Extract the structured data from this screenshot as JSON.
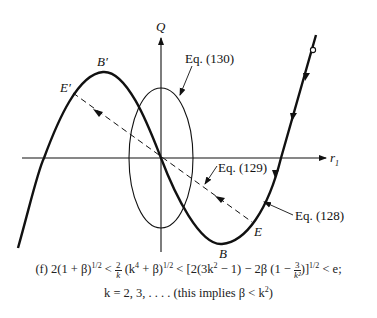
{
  "figure": {
    "type": "phase-plane diagram",
    "axes": {
      "x_label": "r",
      "x_label_sub": "1",
      "y_label": "Q"
    },
    "points": {
      "B_prime": "B′",
      "E_prime": "E′",
      "B": "B",
      "E": "E"
    },
    "annotations": {
      "eq130": "Eq. (130)",
      "eq129": "Eq. (129)",
      "eq128": "Eq. (128)"
    },
    "colors": {
      "ink": "#111111",
      "background": "#ffffff"
    }
  },
  "caption": {
    "line1_prefix": "(f)  2(1 + β)",
    "line1_exp1": "1/2",
    "line1_lt1": " < ",
    "frac_num": "2",
    "frac_den": "k",
    "line1_mid": " (k",
    "line1_k4": "4",
    "line1_mid2": " + β)",
    "line1_exp2": "1/2",
    "line1_lt2": " < ",
    "line1_bracket": "[2(3k",
    "line1_k2": "2",
    "line1_bracket2": " − 1) − 2β (1 − ",
    "frac2_num": "3",
    "frac2_den": "k²",
    "line1_bracket3": ")]",
    "line1_exp3": "1/2",
    "line1_end": " < e;",
    "line2": "k = 2, 3, . . . . (this implies β < k",
    "line2_exp": "2",
    "line2_end": ")"
  }
}
